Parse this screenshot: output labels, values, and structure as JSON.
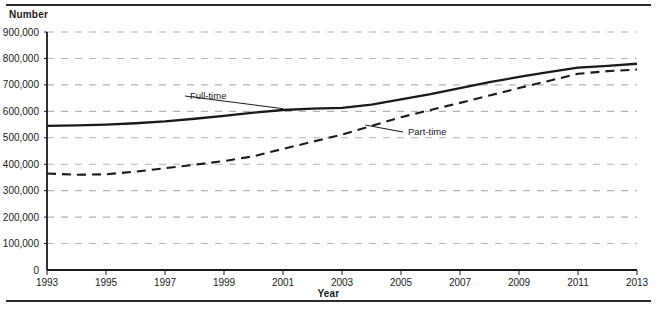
{
  "figure": {
    "y_axis_title": "Number",
    "x_axis_title": "Year"
  },
  "chart_data": {
    "type": "line",
    "title": "",
    "xlabel": "Year",
    "ylabel": "Number",
    "xlim": [
      1993,
      2013
    ],
    "ylim": [
      0,
      900000
    ],
    "ytick_step": 100000,
    "xtick_step": 2,
    "grid": "horizontal-dashed",
    "legend": "inline-annotations",
    "grid_color": "#b3b3b3",
    "line_color": "#1a1a1a",
    "xticks": [
      1993,
      1995,
      1997,
      1999,
      2001,
      2003,
      2005,
      2007,
      2009,
      2011,
      2013
    ],
    "xtick_labels": [
      "1993",
      "1995",
      "1997",
      "1999",
      "2001",
      "2003",
      "2005",
      "2007",
      "2009",
      "2011",
      "2013"
    ],
    "yticks": [
      0,
      100000,
      200000,
      300000,
      400000,
      500000,
      600000,
      700000,
      800000,
      900000
    ],
    "ytick_labels": [
      "0",
      "100,000",
      "200,000",
      "300,000",
      "400,000",
      "500,000",
      "600,000",
      "700,000",
      "800,000",
      "900,000"
    ],
    "x": [
      1993,
      1994,
      1995,
      1996,
      1997,
      1998,
      1999,
      2000,
      2001,
      2002,
      2003,
      2004,
      2005,
      2006,
      2007,
      2008,
      2009,
      2010,
      2011,
      2012,
      2013
    ],
    "series": [
      {
        "name": "Full-time",
        "style": "solid",
        "label": "Full-time",
        "values": [
          545000,
          547000,
          550000,
          555000,
          562000,
          572000,
          583000,
          595000,
          605000,
          610000,
          613000,
          625000,
          645000,
          665000,
          688000,
          710000,
          730000,
          748000,
          765000,
          772000,
          780000
        ]
      },
      {
        "name": "Part-time",
        "style": "dashed",
        "label": "Part-time",
        "values": [
          365000,
          360000,
          362000,
          372000,
          385000,
          398000,
          412000,
          430000,
          458000,
          485000,
          512000,
          545000,
          578000,
          605000,
          632000,
          660000,
          688000,
          715000,
          742000,
          752000,
          758000
        ]
      }
    ],
    "annotations": [
      {
        "text": "Full-time",
        "series": "Full-time",
        "point_year": 2001
      },
      {
        "text": "Part-time",
        "series": "Part-time",
        "point_year": 2004
      }
    ]
  }
}
